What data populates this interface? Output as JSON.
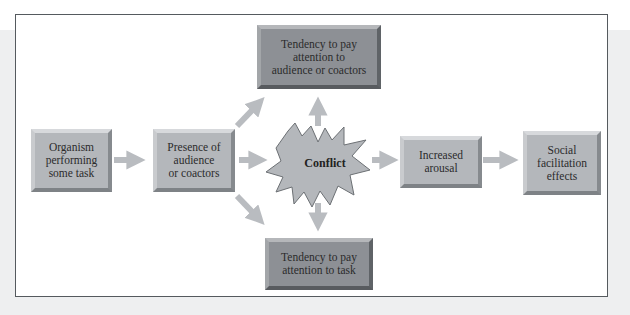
{
  "diagram": {
    "type": "flowchart",
    "nodes": {
      "organism": {
        "lines": [
          "Organism",
          "performing",
          "some task"
        ]
      },
      "presence": {
        "lines": [
          "Presence of",
          "audience",
          "or coactors"
        ]
      },
      "conflict": {
        "label": "Conflict"
      },
      "attend_audience": {
        "lines": [
          "Tendency to pay",
          "attention to",
          "audience or coactors"
        ]
      },
      "attend_task": {
        "lines": [
          "Tendency to pay",
          "attention to task"
        ]
      },
      "arousal": {
        "lines": [
          "Increased",
          "arousal"
        ]
      },
      "social": {
        "lines": [
          "Social",
          "facilitation",
          "effects"
        ]
      }
    },
    "edges": [
      {
        "from": "organism",
        "to": "presence"
      },
      {
        "from": "presence",
        "to": "attend_audience"
      },
      {
        "from": "presence",
        "to": "conflict"
      },
      {
        "from": "presence",
        "to": "attend_task"
      },
      {
        "from": "conflict",
        "to": "attend_audience"
      },
      {
        "from": "conflict",
        "to": "attend_task"
      },
      {
        "from": "conflict",
        "to": "arousal"
      },
      {
        "from": "arousal",
        "to": "social"
      }
    ],
    "colors": {
      "frame_border": "#555a5e",
      "box_light": "#b4b7bb",
      "box_dark": "#8d9095",
      "arrow": "#b9bcc0",
      "star_fill": "#b4b7bb",
      "text": "#2b2b2b"
    }
  }
}
